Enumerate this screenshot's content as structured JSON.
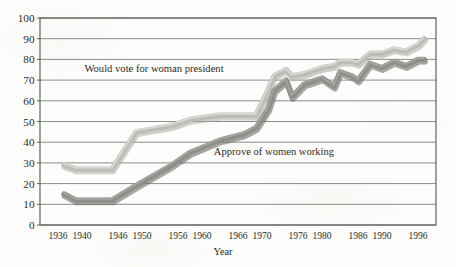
{
  "figure": {
    "type": "line-chart-scan",
    "background_color": "#fdfdfb",
    "ink_color": "#2e2b27"
  },
  "chart_data": {
    "type": "line",
    "title": "",
    "xlabel": "Year",
    "ylabel": "",
    "grid": true,
    "legend_position": "inline-annotation",
    "xlim": [
      1933,
      1999
    ],
    "ylim": [
      0,
      100
    ],
    "ytick_labels": [
      "0",
      "10",
      "20",
      "30",
      "40",
      "50",
      "60",
      "70",
      "80",
      "90",
      "100"
    ],
    "ytick_values": [
      0,
      10,
      20,
      30,
      40,
      50,
      60,
      70,
      80,
      90,
      100
    ],
    "xtick_labels": [
      "1936",
      "1940",
      "1946",
      "1950",
      "1956",
      "1960",
      "1966",
      "1970",
      "1976",
      "1980",
      "1986",
      "1990",
      "1996"
    ],
    "xtick_values": [
      1936,
      1940,
      1946,
      1950,
      1956,
      1960,
      1966,
      1970,
      1976,
      1980,
      1986,
      1990,
      1996
    ],
    "annotations": [
      {
        "text": "Would vote for woman president",
        "x": 1952,
        "y": 74
      },
      {
        "text": "Approve of women working",
        "x": 1972,
        "y": 34
      }
    ],
    "series": [
      {
        "name": "Would vote for woman president",
        "color": "#bdbdb8",
        "x": [
          1937,
          1939,
          1945,
          1949,
          1955,
          1958,
          1963,
          1967,
          1969,
          1971,
          1972,
          1974,
          1975,
          1977,
          1978,
          1980,
          1982,
          1983,
          1985,
          1986,
          1988,
          1990,
          1992,
          1994,
          1996,
          1997
        ],
        "values": [
          29,
          27,
          27,
          45,
          48,
          51,
          53,
          53,
          53,
          65,
          72,
          75,
          72,
          73,
          74,
          76,
          77,
          79,
          79,
          78,
          83,
          83,
          85,
          84,
          87,
          90
        ]
      },
      {
        "name": "Approve of women working",
        "color": "#8f8e8a",
        "x": [
          1937,
          1939,
          1945,
          1949,
          1955,
          1958,
          1963,
          1967,
          1969,
          1971,
          1972,
          1974,
          1975,
          1977,
          1978,
          1980,
          1982,
          1983,
          1985,
          1986,
          1988,
          1990,
          1992,
          1994,
          1996,
          1997
        ],
        "values": [
          15,
          12,
          12,
          19,
          29,
          35,
          41,
          44,
          47,
          56,
          65,
          70,
          62,
          68,
          69,
          71,
          67,
          74,
          72,
          70,
          78,
          76,
          79,
          77,
          80,
          80
        ]
      }
    ]
  }
}
